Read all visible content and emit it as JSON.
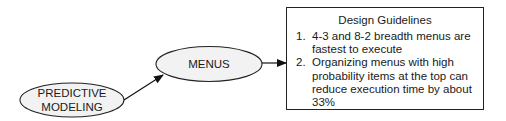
{
  "diagram": {
    "nodes": [
      {
        "id": "predictive-modeling",
        "label_line1": "PREDICTIVE",
        "label_line2": "MODELING"
      },
      {
        "id": "menus",
        "label": "MENUS"
      }
    ],
    "guidelines_box": {
      "title": "Design Guidelines",
      "items": [
        {
          "number": "1.",
          "text": "4-3 and 8-2 breadth menus are fastest to execute"
        },
        {
          "number": "2.",
          "text": "Organizing menus with high probability items at the top can reduce execution time by about 33%"
        }
      ]
    },
    "edges": [
      {
        "from": "predictive-modeling",
        "to": "menus"
      },
      {
        "from": "menus",
        "to": "guidelines_box"
      }
    ],
    "colors": {
      "ellipse_fill": "#f2f2f2",
      "stroke": "#222222"
    }
  }
}
